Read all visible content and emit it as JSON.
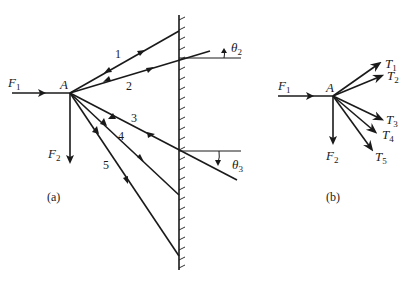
{
  "figure": {
    "part_a": {
      "caption": "(a)",
      "point_label": "A",
      "forces": [
        {
          "name": "F",
          "sub": "1"
        },
        {
          "name": "F",
          "sub": "2"
        }
      ],
      "cables": [
        "1",
        "2",
        "3",
        "4",
        "5"
      ],
      "angles": [
        {
          "name": "θ",
          "sub": "2"
        },
        {
          "name": "θ",
          "sub": "3"
        }
      ]
    },
    "part_b": {
      "caption": "(b)",
      "point_label": "A",
      "forces": [
        {
          "name": "F",
          "sub": "1"
        },
        {
          "name": "F",
          "sub": "2"
        }
      ],
      "tensions": [
        {
          "name": "T",
          "sub": "1"
        },
        {
          "name": "T",
          "sub": "2"
        },
        {
          "name": "T",
          "sub": "3"
        },
        {
          "name": "T",
          "sub": "4"
        },
        {
          "name": "T",
          "sub": "5"
        }
      ]
    }
  }
}
